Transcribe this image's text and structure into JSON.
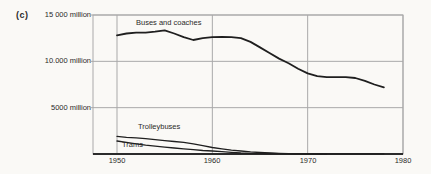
{
  "figure": {
    "panel_label": "(c)",
    "background_color": "#faf9f6",
    "line_color": "#1f1f1f",
    "grid_color": "#a9a9a9",
    "axis_color": "#2b2b2b"
  },
  "chart_data": {
    "type": "line",
    "title": "",
    "xlabel": "",
    "ylabel": "",
    "grid": true,
    "legend_position": "inline-labels",
    "xlim": [
      1947.5,
      1980
    ],
    "ylim": [
      0,
      15000
    ],
    "x_ticks": [
      1950,
      1960,
      1970,
      1980
    ],
    "x_tick_labels": [
      "1950",
      "1960",
      "1970",
      "1980"
    ],
    "y_ticks": [
      15000,
      10000,
      5000
    ],
    "y_tick_labels": [
      "15 000 million",
      "10.000 million",
      "5000 million"
    ],
    "series": [
      {
        "name": "Buses and coaches",
        "x": [
          1950,
          1951,
          1952,
          1953,
          1954,
          1955,
          1956,
          1957,
          1958,
          1959,
          1960,
          1961,
          1962,
          1963,
          1964,
          1965,
          1966,
          1967,
          1968,
          1969,
          1970,
          1971,
          1972,
          1973,
          1974,
          1975,
          1976,
          1977,
          1978
        ],
        "values": [
          12800,
          13000,
          13100,
          13100,
          13200,
          13350,
          13000,
          12600,
          12300,
          12500,
          12600,
          12650,
          12600,
          12500,
          12100,
          11500,
          10900,
          10300,
          9800,
          9200,
          8700,
          8400,
          8300,
          8300,
          8300,
          8200,
          7900,
          7500,
          7200
        ]
      },
      {
        "name": "Trolleybuses",
        "x": [
          1950,
          1951,
          1952,
          1953,
          1954,
          1955,
          1956,
          1957,
          1958,
          1959,
          1960,
          1961,
          1962,
          1963,
          1964,
          1965,
          1966,
          1967,
          1968,
          1969,
          1970,
          1971,
          1972
        ],
        "values": [
          1900,
          1800,
          1750,
          1650,
          1550,
          1450,
          1350,
          1250,
          1100,
          900,
          700,
          550,
          420,
          320,
          230,
          160,
          110,
          70,
          40,
          25,
          15,
          5,
          0
        ]
      },
      {
        "name": "Trams",
        "x": [
          1950,
          1951,
          1952,
          1953,
          1954,
          1955,
          1956,
          1957,
          1958,
          1959,
          1960,
          1961,
          1962,
          1963,
          1964,
          1965,
          1966,
          1967,
          1968,
          1969,
          1970,
          1971,
          1972,
          1973,
          1974,
          1975,
          1976,
          1977,
          1978
        ],
        "values": [
          1400,
          1250,
          1100,
          950,
          850,
          750,
          650,
          550,
          460,
          380,
          320,
          250,
          170,
          110,
          80,
          60,
          50,
          45,
          40,
          35,
          30,
          28,
          26,
          25,
          24,
          23,
          22,
          21,
          20
        ]
      }
    ]
  }
}
